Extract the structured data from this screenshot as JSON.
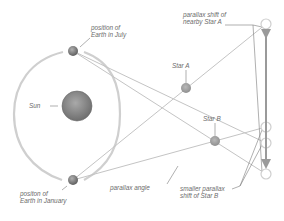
{
  "diagram": {
    "labels": {
      "earth_july": [
        "position of",
        "Earth in July"
      ],
      "earth_january": [
        "positon of",
        "Earth in January"
      ],
      "sun": "Sun",
      "star_a": "Star A",
      "star_b": "Star B",
      "parallax_shift_a": [
        "parallax shift of",
        "nearby Star A"
      ],
      "parallax_angle": "parallax angle",
      "parallax_shift_b": [
        "smaller parallax",
        "shift of Star B"
      ]
    },
    "colors": {
      "orbit": "#cfcfcf",
      "rays": "#c4c4c4",
      "earth": "#8a8a8a",
      "sun": "#8c8c8c",
      "star": "#a8a8a8",
      "arrow": "#9a9a9a",
      "text": "#6b6b6b"
    },
    "objects": {
      "sun": {
        "cx": 77,
        "cy": 106,
        "r": 15
      },
      "earth_july": {
        "cx": 73,
        "cy": 51,
        "r": 5
      },
      "earth_january": {
        "cx": 73,
        "cy": 180,
        "r": 5
      },
      "star_a": {
        "cx": 186,
        "cy": 88,
        "r": 5
      },
      "star_b": {
        "cx": 215,
        "cy": 141,
        "r": 5
      },
      "background_positions": [
        {
          "name": "star-a-apparent-july",
          "cx": 266,
          "cy": 24
        },
        {
          "name": "star-b-apparent-july",
          "cx": 266,
          "cy": 127
        },
        {
          "name": "star-b-apparent-january",
          "cx": 266,
          "cy": 143
        },
        {
          "name": "star-a-apparent-january",
          "cx": 266,
          "cy": 174
        }
      ]
    }
  }
}
